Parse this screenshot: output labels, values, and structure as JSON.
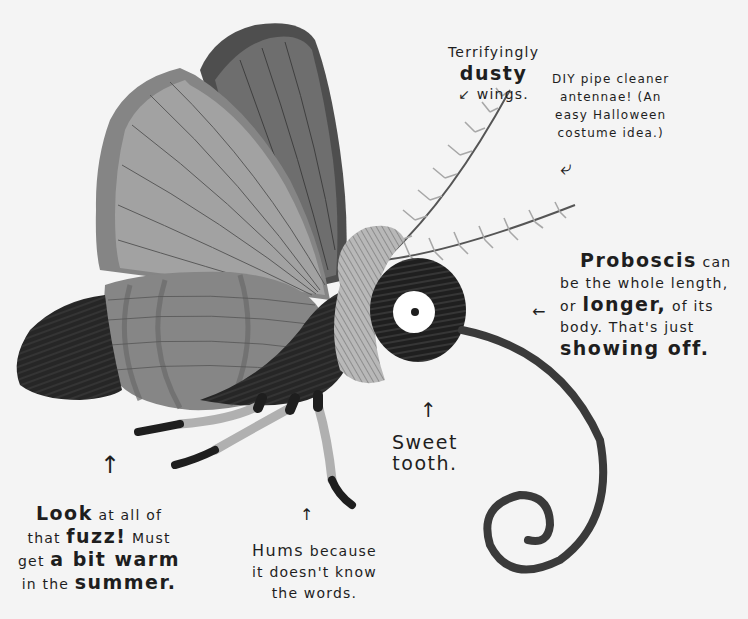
{
  "illustration": {
    "subject": "moth",
    "colors": {
      "background": "#f4f4f4",
      "back_wing": "#6e6e6e",
      "back_wing_edge": "#4a4a4a",
      "front_wing": "#9a9a9a",
      "front_wing_edge": "#808080",
      "hind_wing": "#8a8a8a",
      "body_fur": "#262626",
      "collar_fur": "#b5b5b5",
      "antenna": "#a8a8a8",
      "leg_segment": "#b0b0b0",
      "leg_tip": "#1e1e1e",
      "proboscis": "#3a3a3a",
      "eye_white": "#ffffff",
      "pupil": "#1e1e1e",
      "text": "#1e1e1e"
    }
  },
  "annotations": {
    "wings": {
      "lines": [
        {
          "parts": [
            {
              "text": "Terrifyingly",
              "emphasis": false
            }
          ]
        },
        {
          "parts": [
            {
              "text": "dusty",
              "emphasis": true
            }
          ]
        },
        {
          "parts": [
            {
              "text": "wings.",
              "emphasis": false
            }
          ]
        }
      ],
      "arrow": "↙"
    },
    "antennae": {
      "lines": [
        {
          "parts": [
            {
              "text": "DIY pipe cleaner",
              "emphasis": false
            }
          ]
        },
        {
          "parts": [
            {
              "text": "antennae! (An",
              "emphasis": false
            }
          ]
        },
        {
          "parts": [
            {
              "text": "easy Halloween",
              "emphasis": false
            }
          ]
        },
        {
          "parts": [
            {
              "text": "costume idea.)",
              "emphasis": false
            }
          ]
        }
      ],
      "arrow": "⤶"
    },
    "proboscis": {
      "lines": [
        {
          "parts": [
            {
              "text": "Proboscis",
              "emphasis": true
            },
            {
              "text": " can",
              "emphasis": false
            }
          ]
        },
        {
          "parts": [
            {
              "text": "be the whole length,",
              "emphasis": false
            }
          ]
        },
        {
          "parts": [
            {
              "text": "or ",
              "emphasis": false
            },
            {
              "text": "longer,",
              "emphasis": true
            },
            {
              "text": " of its",
              "emphasis": false
            }
          ]
        },
        {
          "parts": [
            {
              "text": "body. That's just",
              "emphasis": false
            }
          ]
        },
        {
          "parts": [
            {
              "text": "showing off.",
              "emphasis": true
            }
          ]
        }
      ],
      "arrow": "←"
    },
    "sweet_tooth": {
      "lines": [
        {
          "parts": [
            {
              "text": "Sweet",
              "emphasis": true
            }
          ]
        },
        {
          "parts": [
            {
              "text": "tooth.",
              "emphasis": true
            }
          ]
        }
      ],
      "arrow": "↑"
    },
    "fuzz": {
      "lines": [
        {
          "parts": [
            {
              "text": "Look",
              "emphasis": true
            },
            {
              "text": " at all of",
              "emphasis": false
            }
          ]
        },
        {
          "parts": [
            {
              "text": "that ",
              "emphasis": false
            },
            {
              "text": "fuzz!",
              "emphasis": true
            },
            {
              "text": " Must",
              "emphasis": false
            }
          ]
        },
        {
          "parts": [
            {
              "text": "get ",
              "emphasis": false
            },
            {
              "text": "a bit warm",
              "emphasis": true
            }
          ]
        },
        {
          "parts": [
            {
              "text": "in the ",
              "emphasis": false
            },
            {
              "text": "summer.",
              "emphasis": true
            }
          ]
        }
      ],
      "arrow": "↑"
    },
    "hums": {
      "lines": [
        {
          "parts": [
            {
              "text": "Hums",
              "emphasis": true
            },
            {
              "text": " because",
              "emphasis": false
            }
          ]
        },
        {
          "parts": [
            {
              "text": "it doesn't know",
              "emphasis": false
            }
          ]
        },
        {
          "parts": [
            {
              "text": "the words.",
              "emphasis": false
            }
          ]
        }
      ],
      "arrow": "↑"
    }
  }
}
